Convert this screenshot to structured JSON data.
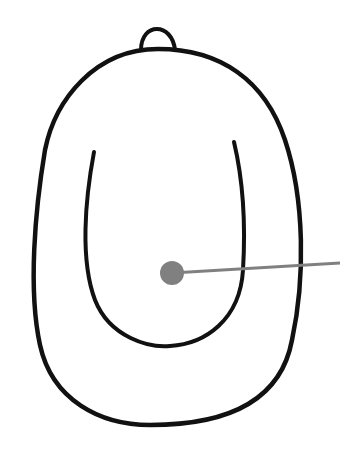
{
  "diagram": {
    "colors": {
      "background": "#ffffff",
      "outline": "#111111",
      "pointer": "#808080"
    },
    "pointer": {
      "dot": {
        "cx": 172,
        "cy": 273,
        "r": 12
      },
      "line": {
        "x1": 172,
        "y1": 273,
        "x2": 340,
        "y2": 263
      },
      "label": ""
    }
  }
}
